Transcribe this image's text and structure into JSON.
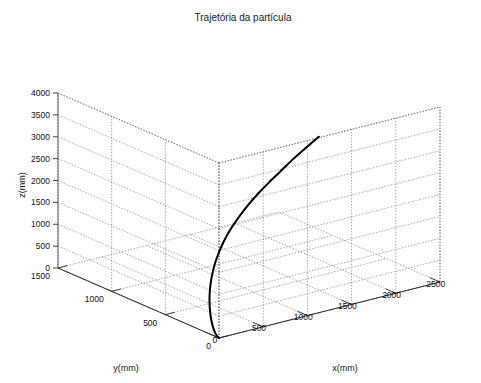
{
  "chart_data": {
    "type": "line",
    "projection": "3d",
    "title": "Trajetória da partícula",
    "xlabel": "x(mm)",
    "ylabel": "y(mm)",
    "zlabel": "z(mm)",
    "xlim": [
      0,
      2500
    ],
    "ylim": [
      0,
      1500
    ],
    "zlim": [
      0,
      4000
    ],
    "xticks": [
      0,
      500,
      1000,
      1500,
      2000,
      2500
    ],
    "xticklabels": [
      "0",
      "500",
      "1000",
      "1500",
      "2000",
      "2500"
    ],
    "yticks": [
      0,
      500,
      1000,
      1500
    ],
    "yticklabels": [
      "0",
      "500",
      "1000",
      "1500"
    ],
    "zticks": [
      0,
      500,
      1000,
      1500,
      2000,
      2500,
      3000,
      3500,
      4000
    ],
    "zticklabels": [
      "0",
      "500",
      "1000",
      "1500",
      "2000",
      "2500",
      "3000",
      "3500",
      "4000"
    ],
    "grid": true,
    "legend": false,
    "series": [
      {
        "name": "trajetória",
        "color": "#000000",
        "linewidth": 2,
        "points": [
          [
            0,
            0,
            0
          ],
          [
            12,
            38,
            35
          ],
          [
            26,
            72,
            120
          ],
          [
            42,
            104,
            250
          ],
          [
            60,
            132,
            420
          ],
          [
            82,
            156,
            620
          ],
          [
            108,
            174,
            850
          ],
          [
            140,
            186,
            1090
          ],
          [
            178,
            192,
            1340
          ],
          [
            222,
            190,
            1600
          ],
          [
            272,
            182,
            1860
          ],
          [
            330,
            168,
            2120
          ],
          [
            396,
            148,
            2380
          ],
          [
            470,
            124,
            2640
          ],
          [
            552,
            96,
            2900
          ],
          [
            644,
            64,
            3160
          ],
          [
            744,
            30,
            3420
          ],
          [
            854,
            0,
            3680
          ],
          [
            974,
            -34,
            3940
          ],
          [
            1060,
            -58,
            4120
          ]
        ]
      }
    ]
  },
  "figure": {
    "background_color": "#ffffff",
    "grid_color": "#7a7a7a",
    "axis_color": "#2b2b2b",
    "text_color": "#111111"
  }
}
